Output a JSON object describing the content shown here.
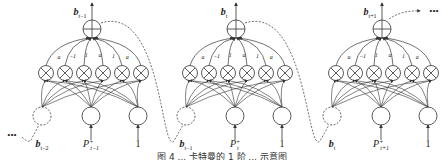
{
  "diagram": {
    "weights": [
      "a",
      "−1",
      "1",
      "a",
      "1",
      "a"
    ],
    "ellipsis": "•••",
    "modules": [
      {
        "output": {
          "base": "b",
          "sub": "t−1"
        },
        "input_b": {
          "base": "b",
          "sub": "t−2"
        },
        "input_p": {
          "base": "P",
          "sup": "+",
          "sub": "t−1"
        },
        "input_one": "1"
      },
      {
        "output": {
          "base": "b",
          "sub": "t"
        },
        "input_b": {
          "base": "b",
          "sub": "t−1"
        },
        "input_p": {
          "base": "P",
          "sup": "+",
          "sub": "t"
        },
        "input_one": "1"
      },
      {
        "output": {
          "base": "b",
          "sub": "t+1"
        },
        "input_b": {
          "base": "b",
          "sub": "t"
        },
        "input_p": {
          "base": "P",
          "sup": "+",
          "sub": "t+1"
        },
        "input_one": "1"
      }
    ],
    "node_symbols": {
      "sum": "⊕",
      "product": "⊗"
    }
  },
  "caption": {
    "text": "图 4 ... 卡特曼的 1 阶 ... 示意图"
  },
  "colors": {
    "stroke": "#333333",
    "background": "#ffffff"
  }
}
